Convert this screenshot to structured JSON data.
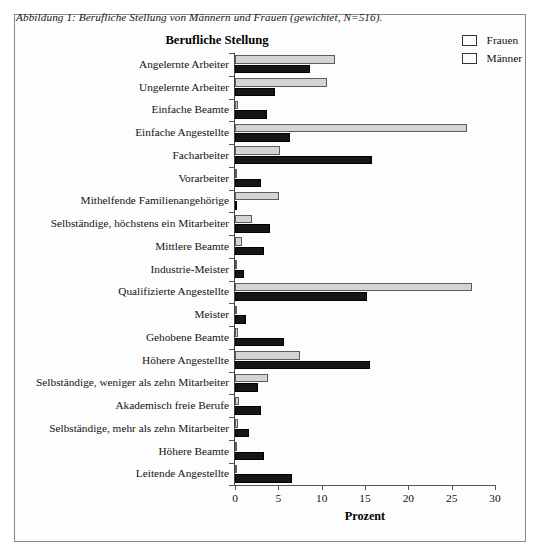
{
  "figure": {
    "caption": "Abbildung 1: Berufliche Stellung von Männern und Frauen (gewichtet, N=516).",
    "title": "Berufliche Stellung"
  },
  "legend": {
    "position": "top-right",
    "entries": [
      {
        "label": "Frauen",
        "color": "#d4d4d4"
      },
      {
        "label": "Männer",
        "color": "#161616"
      }
    ]
  },
  "chart_data": {
    "type": "bar",
    "orientation": "horizontal",
    "title": "Berufliche Stellung",
    "xlabel": "Prozent",
    "ylabel": "",
    "xlim": [
      0,
      30
    ],
    "xticks": [
      0,
      5,
      10,
      15,
      20,
      25,
      30
    ],
    "grid": false,
    "legend_position": "top-right",
    "categories": [
      "Angelernte Arbeiter",
      "Ungelernte Arbeiter",
      "Einfache Beamte",
      "Einfache Angestellte",
      "Facharbeiter",
      "Vorarbeiter",
      "Mithelfende Familienangehörige",
      "Selbständige, höchstens ein Mitarbeiter",
      "Mittlere Beamte",
      "Industrie-Meister",
      "Qualifizierte Angestellte",
      "Meister",
      "Gehobene Beamte",
      "Höhere Angestellte",
      "Selbständige, weniger als zehn Mitarbeiter",
      "Akademisch freie Berufe",
      "Selbständige, mehr als zehn Mitarbeiter",
      "Höhere Beamte",
      "Leitende Angestellte"
    ],
    "series": [
      {
        "name": "Frauen",
        "color": "#d4d4d4",
        "values": [
          11.5,
          10.6,
          0.3,
          26.8,
          5.2,
          0.0,
          5.1,
          2.0,
          0.8,
          0.0,
          27.4,
          0.0,
          0.4,
          7.5,
          3.8,
          0.5,
          0.3,
          0.2,
          0.2
        ]
      },
      {
        "name": "Männer",
        "color": "#161616",
        "values": [
          8.6,
          4.6,
          3.7,
          6.4,
          15.8,
          3.0,
          0.2,
          4.0,
          3.4,
          1.0,
          15.2,
          1.3,
          5.6,
          15.6,
          2.7,
          3.0,
          1.6,
          3.4,
          6.6
        ]
      }
    ]
  }
}
